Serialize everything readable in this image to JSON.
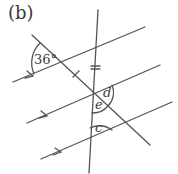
{
  "figure": {
    "part_label": "(b)",
    "angle_labels": {
      "given": "36°",
      "d": "d",
      "e": "e",
      "c": "c"
    },
    "colors": {
      "line": "#555555",
      "text": "#3a3a3a",
      "background": "#ffffff"
    },
    "parallel_lines": [
      {
        "name": "top",
        "x1": 13,
        "y1": 82,
        "x2": 145,
        "y2": 27
      },
      {
        "name": "middle",
        "x1": 27,
        "y1": 123,
        "x2": 160,
        "y2": 65
      },
      {
        "name": "bottom",
        "x1": 41,
        "y1": 159,
        "x2": 172,
        "y2": 102
      }
    ],
    "transversals": [
      {
        "name": "diagonal",
        "x1": 32,
        "y1": 35,
        "x2": 150,
        "y2": 145
      },
      {
        "name": "near-vertical",
        "x1": 98,
        "y1": 10,
        "x2": 89,
        "y2": 173
      }
    ],
    "equal_segment_marks": [
      "single tick on diagonal",
      "double tick on near-vertical"
    ]
  }
}
